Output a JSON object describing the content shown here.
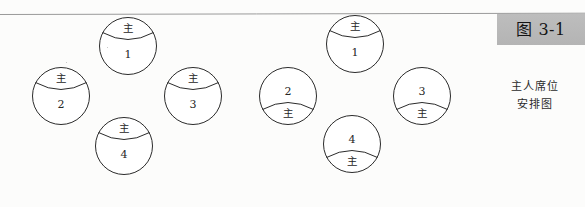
{
  "figure": {
    "label": "图 3-1",
    "caption_line_1": "主人席位",
    "caption_line_2": "安排图",
    "host_marker": "主",
    "label_box_color": "#b9b9b9",
    "stroke_color": "#2b2b2b",
    "background_color": "#fdfdfc"
  },
  "groups": [
    {
      "name": "left-arrangement",
      "seats": [
        {
          "number": "1",
          "host": "主",
          "host_position": "top",
          "x": 98,
          "y": 16
        },
        {
          "number": "2",
          "host": "主",
          "host_position": "top",
          "x": 31,
          "y": 66
        },
        {
          "number": "3",
          "host": "主",
          "host_position": "top",
          "x": 163,
          "y": 66
        },
        {
          "number": "4",
          "host": "主",
          "host_position": "top",
          "x": 94,
          "y": 116
        }
      ]
    },
    {
      "name": "right-arrangement",
      "seats": [
        {
          "number": "1",
          "host": "主",
          "host_position": "top",
          "x": 325,
          "y": 14
        },
        {
          "number": "2",
          "host": "主",
          "host_position": "bottom",
          "x": 258,
          "y": 66
        },
        {
          "number": "3",
          "host": "主",
          "host_position": "bottom",
          "x": 392,
          "y": 66
        },
        {
          "number": "4",
          "host": "主",
          "host_position": "bottom",
          "x": 322,
          "y": 114
        }
      ]
    }
  ]
}
